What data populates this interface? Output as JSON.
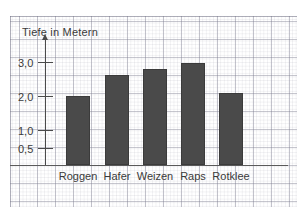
{
  "chart_data": {
    "type": "bar",
    "title": "Tiefe in Metern",
    "xlabel": "",
    "ylabel": "Tiefe in Metern",
    "categories": [
      "Roggen",
      "Hafer",
      "Weizen",
      "Raps",
      "Rotklee"
    ],
    "values": [
      2.0,
      2.6,
      2.8,
      2.95,
      2.1
    ],
    "ytick_labels": [
      "3,0",
      "2,0",
      "1,0",
      "0,5"
    ],
    "ytick_values": [
      3.0,
      2.0,
      1.0,
      0.5
    ],
    "ylim": [
      0,
      3.7
    ],
    "grid": true,
    "legend": null,
    "bar_color": "#4a4a4a",
    "background": "graph-paper"
  },
  "axis": {
    "title": "Tiefe in Metern",
    "arrow": "up-arrow-icon"
  },
  "ticks": [
    {
      "label": "3,0",
      "top": 57,
      "line_top": 62
    },
    {
      "label": "2,0",
      "top": 91,
      "line_top": 96
    },
    {
      "label": "1,0",
      "top": 125,
      "line_top": 130
    },
    {
      "label": "0,5",
      "top": 143,
      "line_top": 148
    }
  ],
  "bars": [
    {
      "label": "Roggen",
      "value": "2,0",
      "left": 66,
      "width": 24,
      "top": 96,
      "height": 69,
      "label_left": 42,
      "label_width": 72
    },
    {
      "label": "Hafer",
      "value": "2,6",
      "left": 105,
      "width": 24,
      "top": 75,
      "height": 90,
      "label_left": 83,
      "label_width": 68
    },
    {
      "label": "Weizen",
      "value": "2,8",
      "left": 143,
      "width": 24,
      "top": 69,
      "height": 96,
      "label_left": 120,
      "label_width": 70
    },
    {
      "label": "Raps",
      "value": "3,0",
      "left": 181,
      "width": 24,
      "top": 63,
      "height": 102,
      "label_left": 163,
      "label_width": 60
    },
    {
      "label": "Rotklee",
      "value": "2,1",
      "left": 219,
      "width": 24,
      "top": 93,
      "height": 72,
      "label_left": 197,
      "label_width": 68
    }
  ]
}
